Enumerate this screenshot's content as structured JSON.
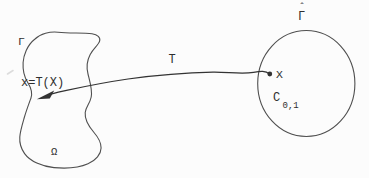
{
  "canvas": {
    "width": 369,
    "height": 178,
    "paper_color": "#fcfcfc",
    "ink_color": "#3c3c3c"
  },
  "figure": {
    "physical_domain": {
      "boundary_label": "Γ",
      "interior_label": "Ω",
      "mapped_point_label": "x=T(X)"
    },
    "transformation": {
      "label": "T"
    },
    "computational_domain": {
      "boundary_label_base": "Γ",
      "boundary_label_hat": "ˆ",
      "region_label_main": "C",
      "region_label_sub": "0,1",
      "point_label": "X"
    }
  }
}
